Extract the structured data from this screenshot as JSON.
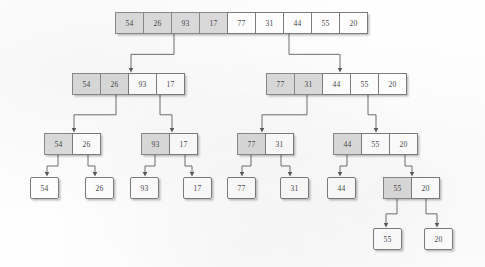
{
  "diagram": {
    "type": "recursion-tree",
    "colors": {
      "shaded_cell": "#dcdcdc",
      "plain_cell": "#ffffff",
      "border": "#7d7d7d",
      "text": "#4a4a4a",
      "background": "#fefefe"
    },
    "cell_height": 22,
    "cell_width": 29,
    "levels": [
      {
        "level": 0,
        "y": 12,
        "nodes": [
          {
            "id": "root",
            "x": 115,
            "cells": [
              {
                "value": "54",
                "shaded": true
              },
              {
                "value": "26",
                "shaded": true
              },
              {
                "value": "93",
                "shaded": true
              },
              {
                "value": "17",
                "shaded": true
              },
              {
                "value": "77",
                "shaded": false
              },
              {
                "value": "31",
                "shaded": false
              },
              {
                "value": "44",
                "shaded": false
              },
              {
                "value": "55",
                "shaded": false
              },
              {
                "value": "20",
                "shaded": false
              }
            ]
          }
        ]
      },
      {
        "level": 1,
        "y": 73,
        "nodes": [
          {
            "id": "L1-left",
            "x": 72,
            "cells": [
              {
                "value": "54",
                "shaded": true
              },
              {
                "value": "26",
                "shaded": true
              },
              {
                "value": "93",
                "shaded": false
              },
              {
                "value": "17",
                "shaded": false
              }
            ]
          },
          {
            "id": "L1-right",
            "x": 266,
            "cells": [
              {
                "value": "77",
                "shaded": true
              },
              {
                "value": "31",
                "shaded": true
              },
              {
                "value": "44",
                "shaded": false
              },
              {
                "value": "55",
                "shaded": false
              },
              {
                "value": "20",
                "shaded": false
              }
            ]
          }
        ]
      },
      {
        "level": 2,
        "y": 133,
        "nodes": [
          {
            "id": "L2-a",
            "x": 44,
            "cells": [
              {
                "value": "54",
                "shaded": true
              },
              {
                "value": "26",
                "shaded": false
              }
            ]
          },
          {
            "id": "L2-b",
            "x": 141,
            "cells": [
              {
                "value": "93",
                "shaded": true
              },
              {
                "value": "17",
                "shaded": false
              }
            ]
          },
          {
            "id": "L2-c",
            "x": 237,
            "cells": [
              {
                "value": "77",
                "shaded": true
              },
              {
                "value": "31",
                "shaded": false
              }
            ]
          },
          {
            "id": "L2-d",
            "x": 333,
            "cells": [
              {
                "value": "44",
                "shaded": true
              },
              {
                "value": "55",
                "shaded": false
              },
              {
                "value": "20",
                "shaded": false
              }
            ]
          }
        ]
      },
      {
        "level": 3,
        "y": 177,
        "nodes": [
          {
            "id": "L3-a",
            "x": 30,
            "cells": [
              {
                "value": "54",
                "shaded": false
              }
            ]
          },
          {
            "id": "L3-b",
            "x": 85,
            "cells": [
              {
                "value": "26",
                "shaded": false
              }
            ]
          },
          {
            "id": "L3-c",
            "x": 130,
            "cells": [
              {
                "value": "93",
                "shaded": false
              }
            ]
          },
          {
            "id": "L3-d",
            "x": 183,
            "cells": [
              {
                "value": "17",
                "shaded": false
              }
            ]
          },
          {
            "id": "L3-e",
            "x": 227,
            "cells": [
              {
                "value": "77",
                "shaded": false
              }
            ]
          },
          {
            "id": "L3-f",
            "x": 280,
            "cells": [
              {
                "value": "31",
                "shaded": false
              }
            ]
          },
          {
            "id": "L3-g",
            "x": 327,
            "cells": [
              {
                "value": "44",
                "shaded": false
              }
            ]
          },
          {
            "id": "L3-h",
            "x": 383,
            "cells": [
              {
                "value": "55",
                "shaded": true
              },
              {
                "value": "20",
                "shaded": false
              }
            ]
          }
        ]
      },
      {
        "level": 4,
        "y": 228,
        "nodes": [
          {
            "id": "L4-a",
            "x": 373,
            "cells": [
              {
                "value": "55",
                "shaded": false
              }
            ]
          },
          {
            "id": "L4-b",
            "x": 424,
            "cells": [
              {
                "value": "20",
                "shaded": false
              }
            ]
          }
        ]
      }
    ],
    "edges": [
      {
        "from": "root",
        "to": "L1-left",
        "sx": 174,
        "sy": 34,
        "ex": 131,
        "ey": 71
      },
      {
        "from": "root",
        "to": "L1-right",
        "sx": 289,
        "sy": 34,
        "ex": 340,
        "ey": 71
      },
      {
        "from": "L1-left",
        "to": "L2-a",
        "sx": 116,
        "sy": 95,
        "ex": 74,
        "ey": 131
      },
      {
        "from": "L1-left",
        "to": "L2-b",
        "sx": 160,
        "sy": 95,
        "ex": 172,
        "ey": 131
      },
      {
        "from": "L1-right",
        "to": "L2-c",
        "sx": 307,
        "sy": 95,
        "ex": 262,
        "ey": 131
      },
      {
        "from": "L1-right",
        "to": "L2-d",
        "sx": 368,
        "sy": 95,
        "ex": 376,
        "ey": 131
      },
      {
        "from": "L2-a",
        "to": "L3-a",
        "sx": 58,
        "sy": 155,
        "ex": 47,
        "ey": 175
      },
      {
        "from": "L2-a",
        "to": "L3-b",
        "sx": 88,
        "sy": 155,
        "ex": 95,
        "ey": 175
      },
      {
        "from": "L2-b",
        "to": "L3-c",
        "sx": 155,
        "sy": 155,
        "ex": 145,
        "ey": 175
      },
      {
        "from": "L2-b",
        "to": "L3-d",
        "sx": 185,
        "sy": 155,
        "ex": 192,
        "ey": 175
      },
      {
        "from": "L2-c",
        "to": "L3-e",
        "sx": 251,
        "sy": 155,
        "ex": 242,
        "ey": 175
      },
      {
        "from": "L2-c",
        "to": "L3-f",
        "sx": 281,
        "sy": 155,
        "ex": 290,
        "ey": 175
      },
      {
        "from": "L2-d",
        "to": "L3-g",
        "sx": 347,
        "sy": 155,
        "ex": 340,
        "ey": 175
      },
      {
        "from": "L2-d",
        "to": "L3-h",
        "sx": 405,
        "sy": 155,
        "ex": 412,
        "ey": 175
      },
      {
        "from": "L3-h",
        "to": "L4-a",
        "sx": 397,
        "sy": 199,
        "ex": 386,
        "ey": 226
      },
      {
        "from": "L3-h",
        "to": "L4-b",
        "sx": 426,
        "sy": 199,
        "ex": 437,
        "ey": 226
      }
    ]
  }
}
